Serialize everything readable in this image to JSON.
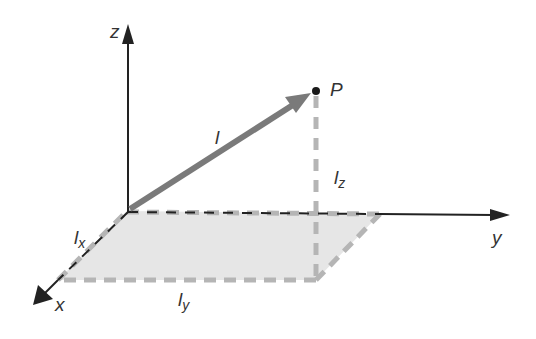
{
  "diagram": {
    "type": "3d-vector-components",
    "colors": {
      "axis": "#222222",
      "vector": "#7a7a7a",
      "plane_fill": "#e6e6e6",
      "dash": "#b5b5b5",
      "point": "#1a1a1a",
      "text": "#333333"
    },
    "axes": {
      "z": {
        "label": "z"
      },
      "y": {
        "label": "y"
      },
      "x": {
        "label": "x"
      }
    },
    "point": {
      "label": "P"
    },
    "vector": {
      "label": "l"
    },
    "components": {
      "lx": {
        "base": "l",
        "sub": "x"
      },
      "ly": {
        "base": "l",
        "sub": "y"
      },
      "lz": {
        "base": "l",
        "sub": "z"
      }
    }
  }
}
